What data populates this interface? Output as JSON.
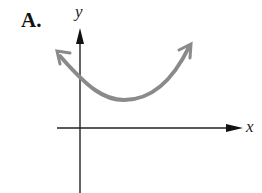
{
  "figure": {
    "label": "A.",
    "x_axis_label": "x",
    "y_axis_label": "y",
    "curve": {
      "type": "parabola",
      "opens": "up",
      "vertex_position": "right of y-axis, above x-axis",
      "color": "#8a8a8a"
    },
    "axis_color": "#222222"
  }
}
